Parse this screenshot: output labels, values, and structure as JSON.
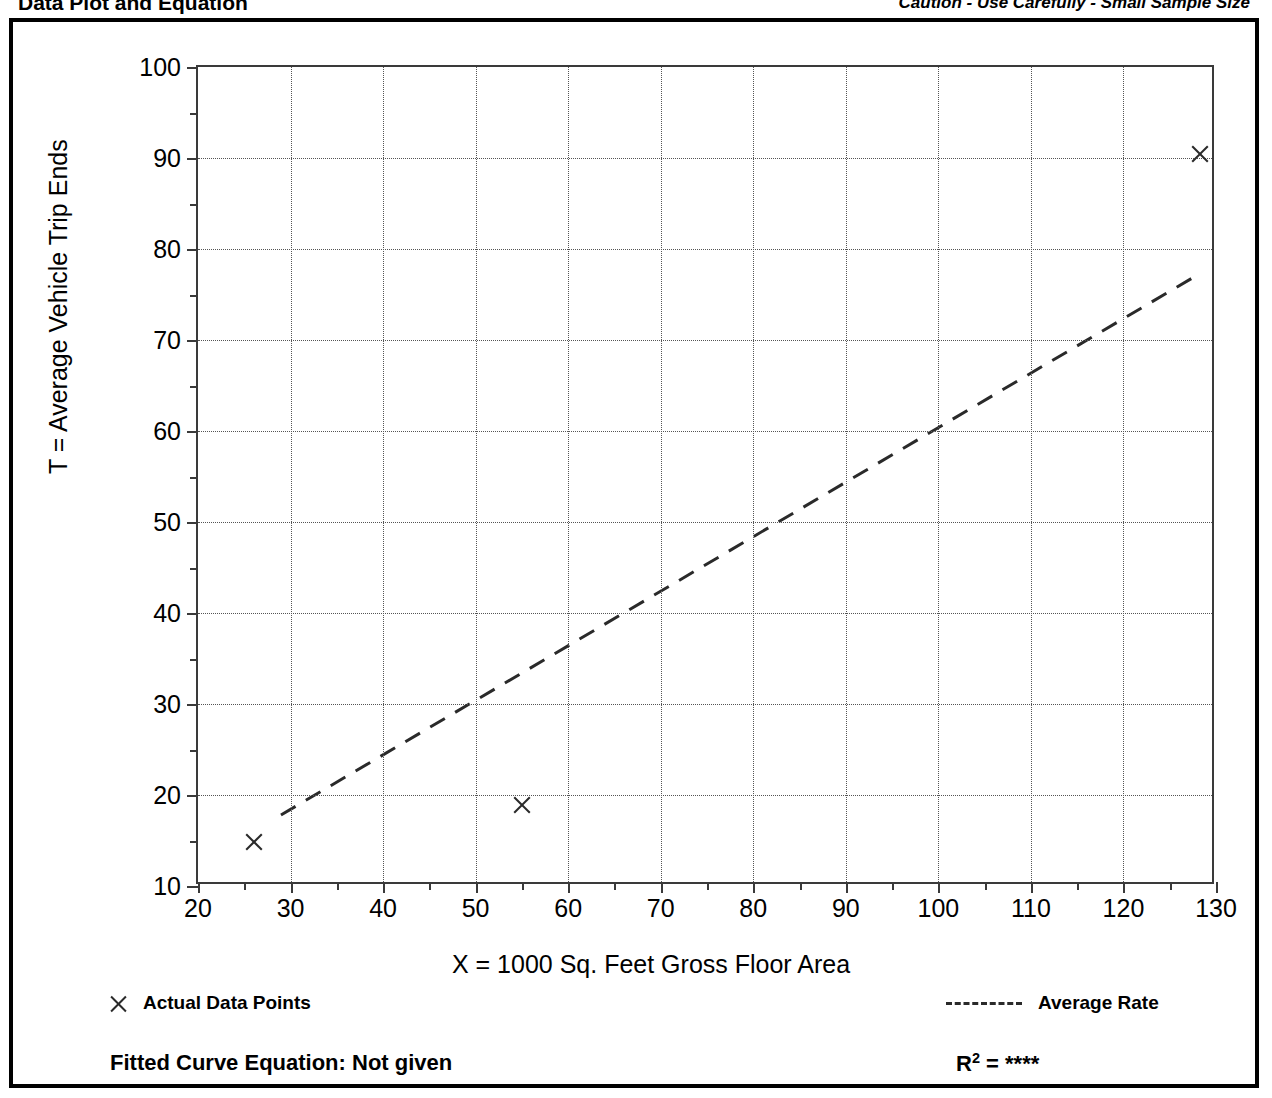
{
  "header": {
    "title": "Data Plot and Equation",
    "caution": "Caution - Use Carefully - Small Sample Size"
  },
  "legend": {
    "data_points_label": "Actual Data Points",
    "average_rate_label": "Average Rate",
    "marker_icon": "x-marker-icon",
    "line_icon": "dashed-line-icon"
  },
  "footer": {
    "equation_label": "Fitted Curve Equation:  Not given",
    "r2_prefix": "R",
    "r2_exponent": "2",
    "r2_equals": " = ",
    "r2_value": "****"
  },
  "chart_data": {
    "type": "scatter",
    "title": "Data Plot and Equation",
    "xlabel": "X = 1000 Sq. Feet Gross Floor Area",
    "ylabel": "T = Average Vehicle Trip Ends",
    "xlim": [
      20,
      130
    ],
    "ylim": [
      10,
      100
    ],
    "xticks": [
      20,
      30,
      40,
      50,
      60,
      70,
      80,
      90,
      100,
      110,
      120,
      130
    ],
    "yticks": [
      10,
      20,
      30,
      40,
      50,
      60,
      70,
      80,
      90,
      100
    ],
    "xticks_minor": [
      25,
      35,
      45,
      55,
      65,
      75,
      85,
      95,
      105,
      115,
      125
    ],
    "yticks_minor": [
      15,
      25,
      35,
      45,
      55,
      65,
      75,
      85,
      95
    ],
    "grid": true,
    "grid_style": "dotted",
    "legend_position": "below-axes",
    "series": [
      {
        "name": "Actual Data Points",
        "type": "scatter",
        "marker": "x",
        "points": [
          {
            "x": 26.0,
            "y": 15.0
          },
          {
            "x": 55.0,
            "y": 19.0
          },
          {
            "x": 128.3,
            "y": 90.5
          }
        ]
      },
      {
        "name": "Average Rate",
        "type": "line",
        "style": "dashed",
        "equation": "T = 0.60 X",
        "points": [
          {
            "x": 29.0,
            "y": 17.4
          },
          {
            "x": 128.7,
            "y": 77.2
          }
        ]
      }
    ],
    "annotations": {
      "fitted_curve_equation": "Not given",
      "r_squared": "****",
      "caution": "Caution - Use Carefully - Small Sample Size"
    }
  }
}
